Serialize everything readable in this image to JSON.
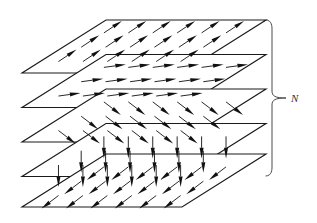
{
  "figure": {
    "background_color": "#ffffff",
    "line_color": "#1a1a1a",
    "arrow_color": "#111111",
    "brace_color": "#4a4a4a",
    "width": 317,
    "height": 223
  },
  "annotation": {
    "brace_label": "N",
    "brace_label_meaning": "number of layers",
    "brace_x": 272,
    "brace_top_y": 20,
    "brace_bottom_y": 176,
    "brace_tip_x": 286,
    "brace_label_x": 291,
    "brace_label_y": 102
  },
  "geometry": {
    "plane_shape": "parallelogram",
    "plane_left_x": 22,
    "plane_front_width": 160,
    "plane_skew_x": 84,
    "plane_depth_y": -53,
    "layer_spacing_y": 34.5,
    "first_layer_front_y": 73,
    "arrow_cols": 6,
    "arrow_rows": 3,
    "arrow_length": 22
  },
  "layers": [
    {
      "index": 1,
      "name": "layer-1-top",
      "front_y": 73,
      "spin_direction": "up-right",
      "spin_angle_deg": -34,
      "arrow_dx": 18,
      "arrow_dy": -12,
      "description": "Arrows tilted up and to the right"
    },
    {
      "index": 2,
      "name": "layer-2",
      "front_y": 107.5,
      "spin_direction": "right",
      "spin_angle_deg": -8,
      "arrow_dx": 22,
      "arrow_dy": -3,
      "description": "Arrows nearly horizontal pointing right"
    },
    {
      "index": 3,
      "name": "layer-3",
      "front_y": 142,
      "spin_direction": "down-right",
      "spin_angle_deg": 38,
      "arrow_dx": 17,
      "arrow_dy": 13,
      "description": "Arrows tilted down and to the right"
    },
    {
      "index": 4,
      "name": "layer-4",
      "front_y": 176.5,
      "spin_direction": "down",
      "spin_angle_deg": 90,
      "arrow_dx": 0,
      "arrow_dy": 22,
      "description": "Arrows pointing straight down"
    },
    {
      "index": 5,
      "name": "layer-5-bottom",
      "front_y": 207,
      "spin_direction": "down-left",
      "spin_angle_deg": 142,
      "arrow_dx": -17,
      "arrow_dy": 13,
      "description": "Arrows tilted down and to the left"
    }
  ]
}
